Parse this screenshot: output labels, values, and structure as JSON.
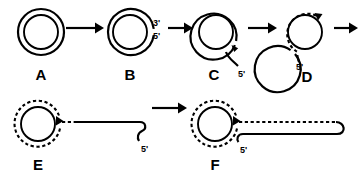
{
  "figure": {
    "type": "biology-process-diagram",
    "background_color": "#ffffff",
    "ink_color": "#000000"
  },
  "panels": [
    {
      "id": "A",
      "letter": "A",
      "description": "Covalently closed circular double-stranded DNA; two concentric solid circles",
      "center": [
        41,
        32
      ],
      "outer_radius": 23,
      "inner_radius": 17,
      "outer_style": "solid",
      "inner_style": "solid",
      "labels": []
    },
    {
      "id": "B",
      "letter": "B",
      "description": "Nick introduced in outer strand at right; free 3' and 5' ends exposed",
      "center": [
        130,
        32
      ],
      "outer_radius": 23,
      "inner_radius": 17,
      "outer_style": "solid-nicked",
      "inner_style": "solid",
      "labels": [
        {
          "text": "3'",
          "x": 157,
          "y": 25
        },
        {
          "text": "5'",
          "x": 157,
          "y": 38
        }
      ]
    },
    {
      "id": "C",
      "letter": "C",
      "description": "5' end displaced from circle forming a short single-stranded tail; arrowhead shows 3' growing end",
      "center": [
        216,
        32
      ],
      "outer_radius": 23,
      "inner_radius": 17,
      "outer_style": "solid-peeled",
      "inner_style": "solid",
      "labels": [
        {
          "text": "5'",
          "x": 241,
          "y": 74
        }
      ]
    },
    {
      "id": "D",
      "letter": "D",
      "description": "New strand (dashed) synthesised on circular template; displaced 5' tail at lower left",
      "center": [
        305,
        32
      ],
      "outer_radius": 23,
      "inner_radius": 17,
      "outer_style": "solid",
      "inner_style": "dashed-new-strand",
      "labels": [
        {
          "text": "5'",
          "x": 300,
          "y": 66
        }
      ]
    },
    {
      "id": "E",
      "letter": "E",
      "description": "Circle with completed new dashed strand; long displaced single-stranded linear tail ending in hooked 5' end",
      "center": [
        38,
        124
      ],
      "outer_radius": 23,
      "inner_radius": 17,
      "outer_style": "dashed-new-strand",
      "inner_style": "solid",
      "labels": [
        {
          "text": "5'",
          "x": 138,
          "y": 152
        }
      ],
      "tail": {
        "style": "single-stranded",
        "from_x": 61,
        "to_x": 145,
        "y": 122
      }
    },
    {
      "id": "F",
      "letter": "F",
      "description": "Displaced tail converted to double-stranded form; dashed top strand hairpins into solid bottom strand",
      "center": [
        215,
        124
      ],
      "outer_radius": 23,
      "inner_radius": 17,
      "outer_style": "dashed-new-strand",
      "inner_style": "solid",
      "labels": [
        {
          "text": "5'",
          "x": 248,
          "y": 152
        }
      ],
      "tail": {
        "style": "double-stranded",
        "from_x": 238,
        "to_x": 345,
        "y": 122
      }
    }
  ],
  "arrows": [
    {
      "id": "arrow-a-to-b",
      "from_panel": "A",
      "to_panel": "B",
      "x1": 66,
      "x2": 100,
      "y": 28
    },
    {
      "id": "arrow-b-to-c",
      "from_panel": "B",
      "to_panel": "C",
      "x1": 166,
      "x2": 190,
      "y": 28
    },
    {
      "id": "arrow-c-to-d",
      "from_panel": "C",
      "to_panel": "D",
      "x1": 244,
      "x2": 277,
      "y": 28
    },
    {
      "id": "arrow-d-to-e",
      "from_panel": "D",
      "to_panel": "E",
      "x1": 333,
      "x2": 357,
      "y": 28
    },
    {
      "id": "arrow-e-to-f",
      "from_panel": "E",
      "to_panel": "F",
      "x1": 152,
      "x2": 188,
      "y": 108
    }
  ],
  "legend_text": {
    "solid_strand": "parental / template strand",
    "dashed_strand": "newly synthesised strand",
    "prime_three": "3'",
    "prime_five": "5'"
  }
}
